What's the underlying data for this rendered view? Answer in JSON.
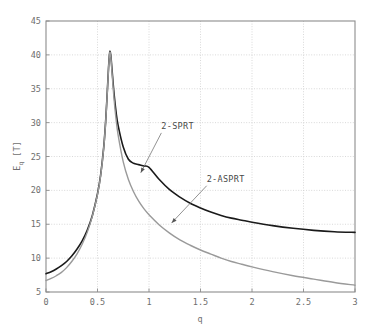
{
  "figure": {
    "background_color": "#ffffff",
    "frame_color": "#8c8c8c",
    "grid_color": "#cfcfcf"
  },
  "axis": {
    "ylabel_main": "E",
    "ylabel_sub": "q",
    "ylabel_unit": " [T]",
    "ylabel_full": "E_q [T]",
    "xlabel": "q",
    "xticks": [
      "0",
      "0.5",
      "1",
      "1.5",
      "2",
      "2.5",
      "3"
    ],
    "yticks": [
      "5",
      "10",
      "15",
      "20",
      "25",
      "30",
      "35",
      "40",
      "45"
    ]
  },
  "annotations": [
    {
      "name": "2-SPRT",
      "label": "2-SPRT"
    },
    {
      "name": "2-ASPRT",
      "label": "2-ASPRT"
    }
  ],
  "chart_data": {
    "type": "line",
    "title": "",
    "xlabel": "q",
    "ylabel": "E_q [T]",
    "xlim": [
      0,
      3
    ],
    "ylim": [
      5,
      45
    ],
    "xticks": [
      0,
      0.5,
      1,
      1.5,
      2,
      2.5,
      3
    ],
    "yticks": [
      5,
      10,
      15,
      20,
      25,
      30,
      35,
      40,
      45
    ],
    "grid": true,
    "legend": "none (inline annotations with arrows)",
    "series": [
      {
        "name": "2-SPRT",
        "color": "#1a1a1a",
        "linewidth": 1.6,
        "annotation": {
          "label": "2-SPRT",
          "text_xy": [
            1.12,
            29.0
          ],
          "arrow_tip_xy": [
            0.92,
            22.6
          ]
        },
        "x": [
          0.0,
          0.05,
          0.1,
          0.15,
          0.2,
          0.25,
          0.3,
          0.35,
          0.4,
          0.45,
          0.5,
          0.53,
          0.56,
          0.58,
          0.6,
          0.61,
          0.62,
          0.63,
          0.64,
          0.66,
          0.68,
          0.7,
          0.75,
          0.8,
          0.85,
          0.9,
          0.95,
          1.0,
          1.1,
          1.2,
          1.3,
          1.4,
          1.5,
          1.6,
          1.7,
          1.8,
          1.9,
          2.0,
          2.2,
          2.4,
          2.6,
          2.8,
          3.0
        ],
        "y": [
          7.7,
          8.0,
          8.4,
          8.9,
          9.5,
          10.3,
          11.3,
          12.5,
          14.1,
          16.3,
          19.5,
          22.2,
          26.3,
          30.4,
          36.0,
          38.8,
          40.5,
          39.8,
          38.0,
          34.4,
          31.6,
          29.6,
          26.4,
          24.6,
          24.0,
          23.8,
          23.6,
          23.4,
          21.6,
          20.1,
          19.0,
          18.1,
          17.4,
          16.8,
          16.3,
          15.9,
          15.6,
          15.3,
          14.8,
          14.4,
          14.1,
          13.9,
          13.8
        ]
      },
      {
        "name": "2-ASPRT",
        "color": "#9a9a9a",
        "linewidth": 1.4,
        "annotation": {
          "label": "2-ASPRT",
          "text_xy": [
            1.56,
            21.2
          ],
          "arrow_tip_xy": [
            1.22,
            15.2
          ]
        },
        "x": [
          0.0,
          0.05,
          0.1,
          0.15,
          0.2,
          0.25,
          0.3,
          0.35,
          0.4,
          0.45,
          0.5,
          0.53,
          0.56,
          0.58,
          0.6,
          0.61,
          0.62,
          0.63,
          0.64,
          0.66,
          0.68,
          0.7,
          0.75,
          0.8,
          0.85,
          0.9,
          0.95,
          1.0,
          1.1,
          1.2,
          1.3,
          1.4,
          1.5,
          1.6,
          1.7,
          1.8,
          1.9,
          2.0,
          2.2,
          2.4,
          2.6,
          2.8,
          3.0
        ],
        "y": [
          6.7,
          7.0,
          7.4,
          7.9,
          8.6,
          9.5,
          10.6,
          12.0,
          13.8,
          16.2,
          19.4,
          22.1,
          26.2,
          30.3,
          35.9,
          38.7,
          40.4,
          39.6,
          37.6,
          33.6,
          30.5,
          28.2,
          24.2,
          21.6,
          19.8,
          18.4,
          17.3,
          16.4,
          14.9,
          13.7,
          12.7,
          11.9,
          11.2,
          10.6,
          10.0,
          9.5,
          9.1,
          8.7,
          8.0,
          7.4,
          6.9,
          6.4,
          6.0
        ]
      }
    ]
  }
}
